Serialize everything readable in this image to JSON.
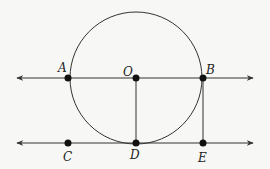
{
  "diagram": {
    "type": "geometry",
    "stroke_color": "#333333",
    "point_color": "#111111",
    "circle": {
      "center": "O",
      "cx": 136,
      "cy": 78,
      "r": 66
    },
    "lines": [
      {
        "name": "line-AB",
        "y": 78,
        "x1": 17,
        "x2": 253,
        "arrows": "both"
      },
      {
        "name": "line-CE",
        "y": 143,
        "x1": 17,
        "x2": 253,
        "arrows": "both"
      }
    ],
    "segments": [
      {
        "name": "segment-OD",
        "from": "O",
        "to": "D"
      },
      {
        "name": "segment-BE",
        "from": "B",
        "to": "E"
      }
    ],
    "points": [
      {
        "label": "A",
        "x": 68,
        "y": 78,
        "lx": 58,
        "ly": 72
      },
      {
        "label": "O",
        "x": 136,
        "y": 78,
        "lx": 123,
        "ly": 76
      },
      {
        "label": "B",
        "x": 203,
        "y": 78,
        "lx": 206,
        "ly": 74
      },
      {
        "label": "C",
        "x": 68,
        "y": 143,
        "lx": 63,
        "ly": 161
      },
      {
        "label": "D",
        "x": 136,
        "y": 143,
        "lx": 130,
        "ly": 159
      },
      {
        "label": "E",
        "x": 203,
        "y": 143,
        "lx": 198,
        "ly": 162
      }
    ]
  }
}
